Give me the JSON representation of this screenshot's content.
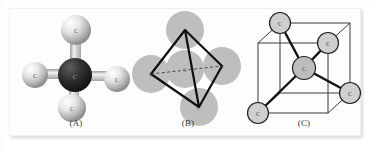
{
  "figure": {
    "background_color": "#ffffff",
    "panel_background_color": "#fdfdfd",
    "panels": [
      {
        "id": "A",
        "caption": "(A)",
        "kind": "ball-and-stick",
        "description": "Ball-and-stick model of a tetrahedral molecule",
        "center_atom": {
          "label": "C",
          "color": "#2b2b2b"
        },
        "outer_atoms": [
          {
            "label": "C",
            "position": "top",
            "color": "#d8d8d8"
          },
          {
            "label": "C",
            "position": "left",
            "color": "#d8d8d8"
          },
          {
            "label": "C",
            "position": "right",
            "color": "#d8d8d8"
          },
          {
            "label": "C",
            "position": "bottom-front",
            "color": "#e2e2e2"
          }
        ],
        "bond_color": "#c9c9c9"
      },
      {
        "id": "B",
        "caption": "(B)",
        "kind": "space-filling-with-tetrahedron",
        "description": "Overlapping grey spheres with a black tetrahedron outline",
        "sphere_color": "#a8a8a8",
        "outline_color": "#111111",
        "spheres": [
          {
            "label": "C",
            "position": "top"
          },
          {
            "label": "C",
            "position": "left"
          },
          {
            "label": "C",
            "position": "right"
          },
          {
            "label": "C",
            "position": "bottom"
          },
          {
            "label": "C",
            "position": "center"
          }
        ]
      },
      {
        "id": "C",
        "caption": "(C)",
        "kind": "cube-inscribed-tetrahedron",
        "description": "Cube with atoms at four alternating corners bonded to a central atom",
        "cube_edge_color": "#333333",
        "bond_color": "#111111",
        "atom_fill": "#cfcfcf",
        "atom_stroke": "#222222",
        "atoms": [
          {
            "label": "C",
            "position": "center"
          },
          {
            "label": "C",
            "position": "top-back-left"
          },
          {
            "label": "C",
            "position": "top-front-right"
          },
          {
            "label": "C",
            "position": "bottom-front-left"
          },
          {
            "label": "C",
            "position": "bottom-back-right"
          }
        ]
      }
    ]
  }
}
